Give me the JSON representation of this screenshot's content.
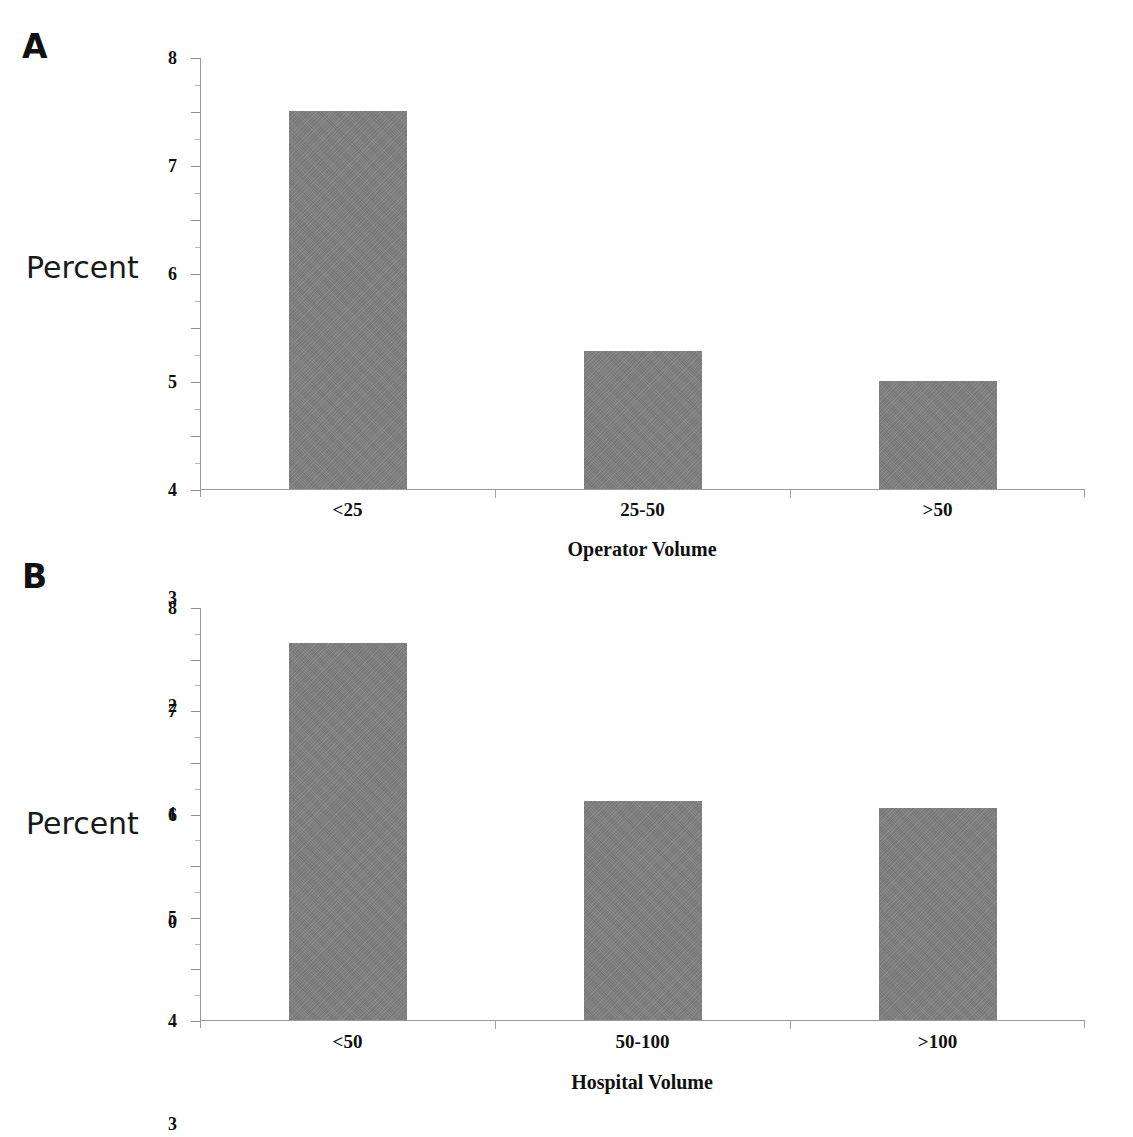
{
  "figure": {
    "background_color": "#ffffff",
    "bar_color": "#808080",
    "axis_color": "#9a9a9a",
    "text_color": "#101010"
  },
  "panels": [
    {
      "letter": "A",
      "y_axis_title": "Percent",
      "x_axis_title": "Operator Volume",
      "y_ticks": [
        "0",
        "1",
        "2",
        "3",
        "4",
        "5",
        "6",
        "7",
        "8"
      ],
      "categories": [
        "<25",
        "25-50",
        ">50"
      ],
      "values": [
        7.0,
        2.55,
        2.0
      ]
    },
    {
      "letter": "B",
      "y_axis_title": "Percent",
      "x_axis_title": "Hospital Volume",
      "y_ticks": [
        "0",
        "1",
        "2",
        "3",
        "4",
        "5",
        "6",
        "7",
        "8"
      ],
      "categories": [
        "<50",
        "50-100",
        ">100"
      ],
      "values": [
        7.3,
        4.25,
        4.1
      ]
    }
  ],
  "chart_data": [
    {
      "type": "bar",
      "panel": "A",
      "title": "",
      "categories": [
        "<25",
        "25-50",
        ">50"
      ],
      "values": [
        7.0,
        2.55,
        2.0
      ],
      "xlabel": "Operator Volume",
      "ylabel": "Percent",
      "ylim": [
        0,
        8
      ],
      "ytick_values": [
        0,
        1,
        2,
        3,
        4,
        5,
        6,
        7,
        8
      ],
      "ytick_labels": [
        "0",
        "1",
        "2",
        "3",
        "4",
        "5",
        "6",
        "7",
        "8"
      ],
      "grid": false,
      "legend": false,
      "bar_color": "#808080"
    },
    {
      "type": "bar",
      "panel": "B",
      "title": "",
      "categories": [
        "<50",
        "50-100",
        ">100"
      ],
      "values": [
        7.3,
        4.25,
        4.1
      ],
      "xlabel": "Hospital Volume",
      "ylabel": "Percent",
      "ylim": [
        0,
        8
      ],
      "ytick_values": [
        0,
        1,
        2,
        3,
        4,
        5,
        6,
        7,
        8
      ],
      "ytick_labels": [
        "0",
        "1",
        "2",
        "3",
        "4",
        "5",
        "6",
        "7",
        "8"
      ],
      "grid": false,
      "legend": false,
      "bar_color": "#808080"
    }
  ]
}
